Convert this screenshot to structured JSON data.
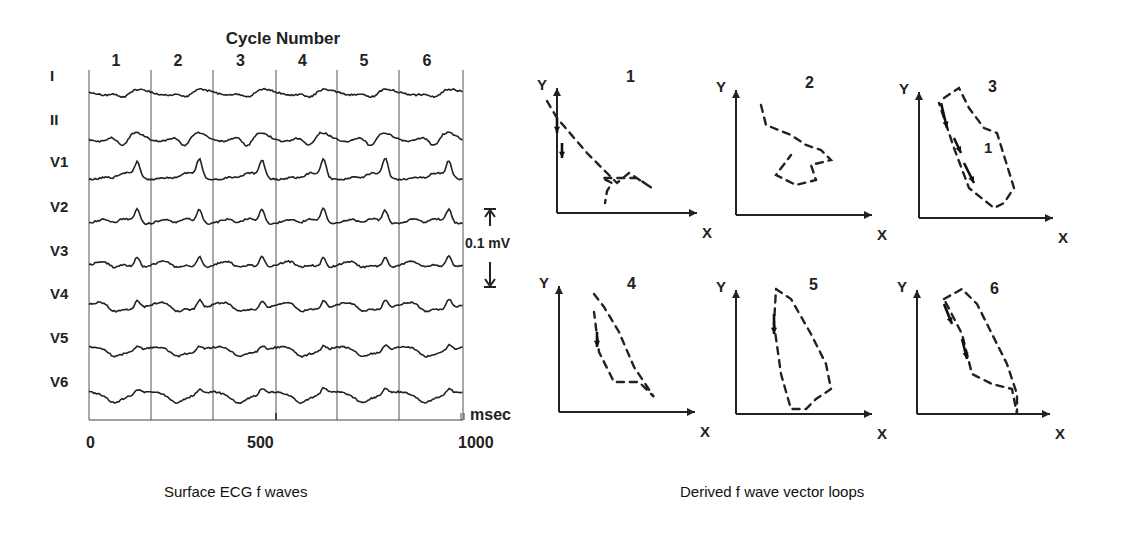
{
  "left_panel": {
    "title": "Cycle Number",
    "caption": "Surface ECG f waves",
    "cycles": [
      "1",
      "2",
      "3",
      "4",
      "5",
      "6"
    ],
    "leads": [
      "I",
      "II",
      "V1",
      "V2",
      "V3",
      "V4",
      "V5",
      "V6"
    ],
    "x_ticks": [
      "0",
      "500",
      "1000"
    ],
    "x_unit": "msec",
    "scale_label": "0.1 mV"
  },
  "right_panel": {
    "caption": "Derived f wave vector loops",
    "loops": [
      {
        "label": "1",
        "x_axis": "X",
        "y_axis": "Y"
      },
      {
        "label": "2",
        "x_axis": "X",
        "y_axis": "Y"
      },
      {
        "label": "3",
        "x_axis": "X",
        "y_axis": "Y"
      },
      {
        "label": "4",
        "x_axis": "X",
        "y_axis": "Y"
      },
      {
        "label": "5",
        "x_axis": "X",
        "y_axis": "Y"
      },
      {
        "label": "6",
        "x_axis": "X",
        "y_axis": "Y"
      }
    ]
  },
  "chart_data": [
    {
      "type": "line",
      "title": "Cycle Number",
      "caption": "Surface ECG f waves",
      "xlabel": "msec",
      "ylabel": "",
      "xlim": [
        0,
        1000
      ],
      "x_ticks": [
        0,
        500,
        1000
      ],
      "cycle_boundaries_ms": [
        0,
        165,
        330,
        495,
        660,
        830,
        995
      ],
      "cycle_labels": [
        "1",
        "2",
        "3",
        "4",
        "5",
        "6"
      ],
      "amplitude_scale": "0.1 mV",
      "series": [
        {
          "name": "I"
        },
        {
          "name": "II"
        },
        {
          "name": "V1"
        },
        {
          "name": "V2"
        },
        {
          "name": "V3"
        },
        {
          "name": "V4"
        },
        {
          "name": "V5"
        },
        {
          "name": "V6"
        }
      ]
    },
    {
      "type": "scatter",
      "title": "Derived f wave vector loops",
      "panels": [
        "1",
        "2",
        "3",
        "4",
        "5",
        "6"
      ],
      "xlabel": "X",
      "ylabel": "Y",
      "note": "Dashed vector loops with direction arrows; loop 3 annotated with '1'"
    }
  ]
}
